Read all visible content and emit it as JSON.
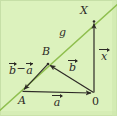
{
  "figure": {
    "kind": "vector-geometry-diagram",
    "width": 117,
    "height": 116,
    "background_color": "#dcf2bd",
    "line_color": "#8fbf4f",
    "stroke_color": "#2d2a26"
  },
  "labels": {
    "point_x": "X",
    "point_b": "B",
    "point_a": "A",
    "origin": "0",
    "line_g": "g"
  },
  "vectors": {
    "a": "a",
    "b": "b",
    "x": "x",
    "b_minus_a_first": "b",
    "b_minus_a_operator": "−",
    "b_minus_a_second": "a"
  },
  "geometry": {
    "points": {
      "A": [
        22,
        91
      ],
      "B": [
        48,
        64
      ],
      "O": [
        94,
        93
      ],
      "X": [
        94,
        21
      ]
    },
    "line_g": {
      "from": [
        -2,
        112
      ],
      "to": [
        119,
        3
      ]
    },
    "segments": [
      {
        "name": "vector-a",
        "from": [
          22,
          91
        ],
        "to": [
          94,
          93
        ]
      },
      {
        "name": "vector-b",
        "from": [
          94,
          93
        ],
        "to": [
          48,
          64
        ]
      },
      {
        "name": "vector-b-minus-a",
        "from": [
          48,
          64
        ],
        "to": [
          22,
          91
        ]
      },
      {
        "name": "vector-x",
        "from": [
          94,
          93
        ],
        "to": [
          94,
          21
        ]
      }
    ]
  }
}
